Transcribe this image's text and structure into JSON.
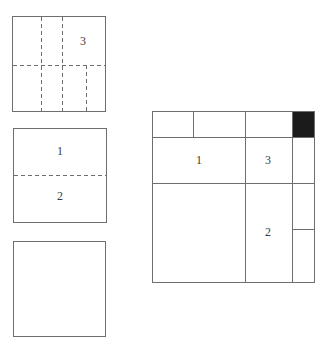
{
  "palette": {
    "background": "#ffffff",
    "line": "#6e6e6e",
    "label": "#3c3c3c",
    "shaded": "#1b1b1b"
  },
  "squares": {
    "dashed_grid": {
      "label": "3"
    },
    "halved": {
      "top_label": "1",
      "bottom_label": "2"
    },
    "composite": {
      "left_cell_label": "1",
      "middle_cell_label": "3",
      "lower_middle_cell_label": "2"
    }
  }
}
